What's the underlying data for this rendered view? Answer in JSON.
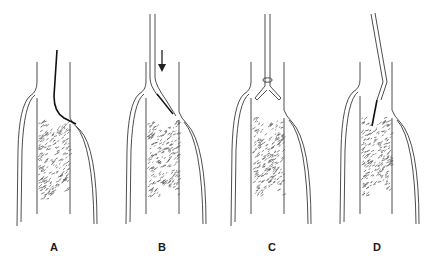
{
  "figure": {
    "panels": [
      {
        "id": "A",
        "label": "A",
        "left": 0,
        "label_x": 44,
        "device": "guidewire"
      },
      {
        "id": "B",
        "label": "B",
        "left": 110,
        "label_x": 42,
        "device": "catheter-with-arrow"
      },
      {
        "id": "C",
        "label": "C",
        "left": 217,
        "label_x": 45,
        "device": "forked-catheter"
      },
      {
        "id": "D",
        "label": "D",
        "left": 327,
        "label_x": 40,
        "device": "angled-catheter"
      }
    ],
    "colors": {
      "line": "#3a3a3a",
      "wire": "#111111",
      "clot": "#555555",
      "background": "#ffffff"
    }
  }
}
